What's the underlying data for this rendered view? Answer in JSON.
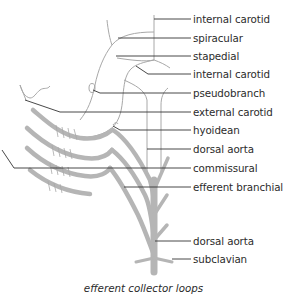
{
  "diagram": {
    "caption": "efferent collector loops",
    "labels": [
      {
        "id": "internal-carotid-upper",
        "text": "internal carotid",
        "y": 19
      },
      {
        "id": "spiracular",
        "text": "spiracular",
        "y": 38
      },
      {
        "id": "stapedial",
        "text": "stapedial",
        "y": 56
      },
      {
        "id": "internal-carotid-lower",
        "text": "internal carotid",
        "y": 74
      },
      {
        "id": "pseudobranch",
        "text": "pseudobranch",
        "y": 93
      },
      {
        "id": "external-carotid",
        "text": "external carotid",
        "y": 112
      },
      {
        "id": "hyoidean",
        "text": "hyoidean",
        "y": 130
      },
      {
        "id": "dorsal-aorta-upper",
        "text": "dorsal aorta",
        "y": 149
      },
      {
        "id": "commissural",
        "text": "commissural",
        "y": 168
      },
      {
        "id": "efferent-branchial",
        "text": "efferent branchial",
        "y": 187
      },
      {
        "id": "dorsal-aorta-lower",
        "text": "dorsal aorta",
        "y": 241
      },
      {
        "id": "subclavian",
        "text": "subclavian",
        "y": 259
      }
    ],
    "colors": {
      "vessel_thin": "#a8a8a8",
      "vessel_thick": "#b5b5b5",
      "leader_line": "#333333",
      "text": "#2b2b2b"
    }
  }
}
